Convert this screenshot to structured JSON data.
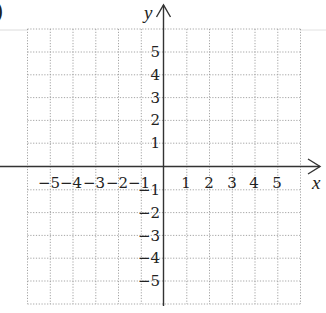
{
  "figure": {
    "corner_glyph": ")",
    "x_axis_label": "x",
    "y_axis_label": "y",
    "x_ticks_negative": [
      "−5",
      "−4",
      "−3",
      "−2",
      "−1"
    ],
    "x_ticks_positive": [
      "1",
      "2",
      "3",
      "4",
      "5"
    ],
    "y_ticks_positive": [
      "5",
      "4",
      "3",
      "2",
      "1"
    ],
    "y_ticks_negative": [
      "−1",
      "−2",
      "−3",
      "−4",
      "−5"
    ],
    "grid": {
      "x_range": [
        -6,
        6
      ],
      "y_range": [
        -6,
        6
      ],
      "step": 1,
      "line_style": "dotted"
    },
    "colors": {
      "axis": "#333333",
      "grid": "#9a9a9a",
      "text": "#222222",
      "faint_rule": "#d8d8d8"
    }
  }
}
